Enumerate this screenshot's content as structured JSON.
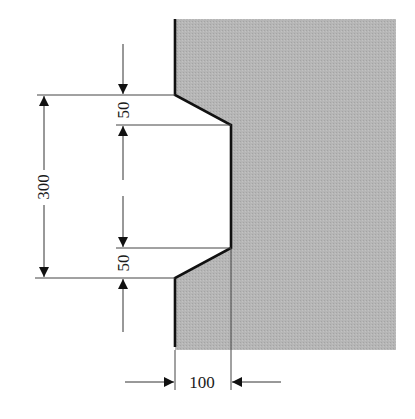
{
  "diagram": {
    "type": "dimensioned-cross-section",
    "colors": {
      "fill": "#b4b4b4",
      "outline": "#111111",
      "dim_line": "#333333",
      "text": "#1a1a1a"
    },
    "dimensions": {
      "overall_height": "300",
      "top_chamfer": "50",
      "bottom_chamfer": "50",
      "notch_depth": "100"
    }
  }
}
